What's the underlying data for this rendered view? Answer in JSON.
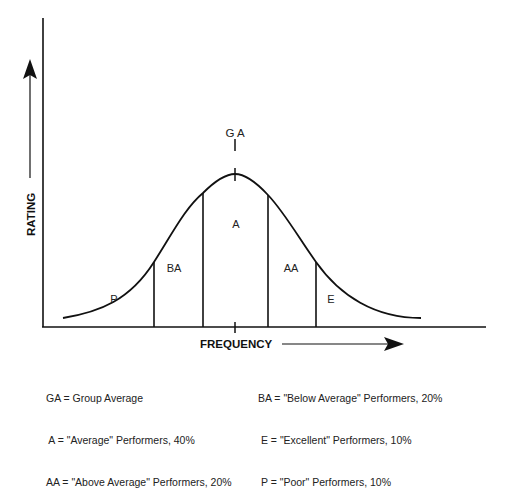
{
  "diagram": {
    "y_axis_label": "RATING",
    "x_axis_label": "FREQUENCY",
    "center_marker_label": "G A",
    "regions": [
      {
        "code": "P",
        "name": "Poor",
        "percent": 10
      },
      {
        "code": "BA",
        "name": "Below Average",
        "percent": 20
      },
      {
        "code": "A",
        "name": "Average",
        "percent": 40
      },
      {
        "code": "AA",
        "name": "Above Average",
        "percent": 20
      },
      {
        "code": "E",
        "name": "Excellent",
        "percent": 10
      }
    ]
  },
  "legend": {
    "left": [
      "GA = Group Average",
      " A = \"Average\" Performers, 40%",
      "AA = \"Above Average\" Performers, 20%"
    ],
    "right": [
      "BA = \"Below Average\" Performers, 20%",
      " E = \"Excellent\" Performers, 10%",
      " P = \"Poor\" Performers, 10%"
    ]
  }
}
